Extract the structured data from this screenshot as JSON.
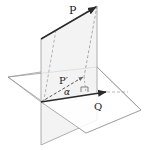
{
  "diagram": {
    "labels": {
      "P": "P",
      "P_prime": "P′",
      "alpha": "α",
      "Q": "Q"
    },
    "colors": {
      "vector": "#2a2a2a",
      "plane_edge": "#9a9a9a",
      "plane_fill_vertical": "#ececec",
      "dashed": "#8a8a8a"
    }
  }
}
